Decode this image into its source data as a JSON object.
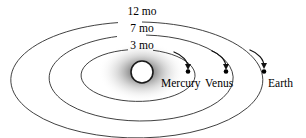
{
  "diagram": {
    "background_color": "#ffffff",
    "stroke_color": "#2b2b2b",
    "sun": {
      "name": "Sun",
      "cx": 142,
      "cy": 72,
      "r": 11,
      "glow_color": "#9a9a9a"
    },
    "orbits": [
      {
        "id": "mercury-orbit",
        "label": "3 mo",
        "label_x": 142,
        "label_y": 49,
        "cx": 142,
        "cy": 75,
        "rx": 57,
        "ry": 26,
        "gap_deg": 26
      },
      {
        "id": "venus-orbit",
        "label": "7 mo",
        "label_x": 142,
        "label_y": 32,
        "cx": 142,
        "cy": 78,
        "rx": 92,
        "ry": 43,
        "gap_deg": 18
      },
      {
        "id": "earth-orbit",
        "label": "12 mo",
        "label_x": 142,
        "label_y": 15,
        "cx": 142,
        "cy": 80,
        "rx": 126,
        "ry": 58,
        "gap_deg": 14
      }
    ],
    "planets": [
      {
        "id": "mercury",
        "label": "Mercury",
        "dot_x": 188,
        "dot_y": 71,
        "label_x": 162,
        "label_y": 86,
        "arrow": "M 176 55 C 183 57 188 62 188 68"
      },
      {
        "id": "venus",
        "label": "Venus",
        "dot_x": 226,
        "dot_y": 71,
        "label_x": 206,
        "label_y": 86,
        "arrow": "M 213 54 C 221 56 226 62 226 68"
      },
      {
        "id": "earth",
        "label": "Earth",
        "dot_x": 264,
        "dot_y": 71,
        "label_x": 267,
        "label_y": 86,
        "arrow": "M 251 53 C 259 56 264 62 264 68"
      }
    ]
  }
}
